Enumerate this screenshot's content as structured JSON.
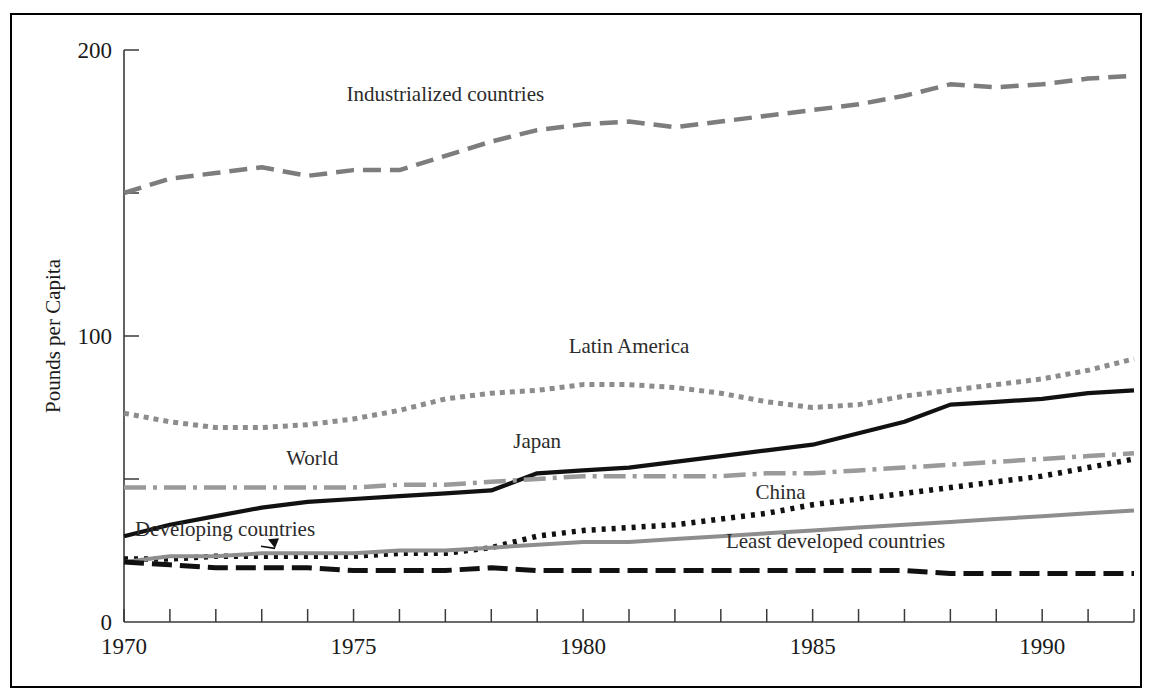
{
  "chart_data": {
    "type": "line",
    "title": "",
    "xlabel": "",
    "ylabel": "Pounds per Capita",
    "xlim": [
      1970,
      1992
    ],
    "ylim": [
      0,
      200
    ],
    "grid": false,
    "legend_position": "inline-labels",
    "y_ticks": [
      0,
      50,
      100,
      150,
      200
    ],
    "y_tick_labels": [
      "0",
      "",
      "100",
      "",
      "200"
    ],
    "x_ticks": [
      1970,
      1971,
      1972,
      1973,
      1974,
      1975,
      1976,
      1977,
      1978,
      1979,
      1980,
      1981,
      1982,
      1983,
      1984,
      1985,
      1986,
      1987,
      1988,
      1989,
      1990,
      1991,
      1992
    ],
    "x_tick_labels": [
      "1970",
      "",
      "",
      "",
      "",
      "1975",
      "",
      "",
      "",
      "",
      "1980",
      "",
      "",
      "",
      "",
      "1985",
      "",
      "",
      "",
      "",
      "1990",
      "",
      ""
    ],
    "x": [
      1970,
      1971,
      1972,
      1973,
      1974,
      1975,
      1976,
      1977,
      1978,
      1979,
      1980,
      1981,
      1982,
      1983,
      1984,
      1985,
      1986,
      1987,
      1988,
      1989,
      1990,
      1991,
      1992
    ],
    "series": [
      {
        "name": "Industrialized countries",
        "color": "#7d7d7d",
        "dash": "18,9",
        "width": 4.5,
        "label_x": 1977.0,
        "label_y": 182,
        "values": [
          150,
          155,
          157,
          159,
          156,
          158,
          158,
          163,
          168,
          172,
          174,
          175,
          173,
          175,
          177,
          179,
          181,
          184,
          188,
          187,
          188,
          190,
          191
        ]
      },
      {
        "name": "Latin America",
        "color": "#8c8c8c",
        "dash": "5,5",
        "width": 5,
        "label_x": 1981.0,
        "label_y": 94,
        "values": [
          73,
          70,
          68,
          68,
          69,
          71,
          74,
          78,
          80,
          81,
          83,
          83,
          82,
          80,
          77,
          75,
          76,
          79,
          81,
          83,
          85,
          88,
          92
        ]
      },
      {
        "name": "Japan",
        "color": "#111111",
        "dash": "",
        "width": 4.2,
        "label_x": 1979.0,
        "label_y": 61,
        "values": [
          30,
          34,
          37,
          40,
          42,
          43,
          44,
          45,
          46,
          52,
          53,
          54,
          56,
          58,
          60,
          62,
          66,
          70,
          76,
          77,
          78,
          80,
          81
        ]
      },
      {
        "name": "World",
        "color": "#9a9a9a",
        "dash": "22,7,4,7",
        "width": 4.5,
        "label_x": 1974.1,
        "label_y": 55,
        "values": [
          47,
          47,
          47,
          47,
          47,
          47,
          48,
          48,
          49,
          50,
          51,
          51,
          51,
          51,
          52,
          52,
          53,
          54,
          55,
          56,
          57,
          58,
          59
        ]
      },
      {
        "name": "China",
        "color": "#111111",
        "dash": "4,6",
        "width": 5.5,
        "label_x": 1984.3,
        "label_y": 43,
        "values": [
          22,
          22,
          23,
          23,
          23,
          23,
          24,
          24,
          26,
          30,
          32,
          33,
          34,
          36,
          38,
          41,
          43,
          45,
          47,
          49,
          51,
          54,
          57
        ]
      },
      {
        "name": "Developing countries",
        "color": "#8e8e8e",
        "dash": "",
        "width": 4,
        "label_x": 1972.2,
        "label_y": 30,
        "arrow": true,
        "values": [
          21,
          23,
          23,
          24,
          24,
          24,
          25,
          25,
          26,
          27,
          28,
          28,
          29,
          30,
          31,
          32,
          33,
          34,
          35,
          36,
          37,
          38,
          39
        ]
      },
      {
        "name": "Least developed countries",
        "color": "#111111",
        "dash": "20,8",
        "width": 5,
        "label_x": 1985.5,
        "label_y": 26,
        "values": [
          21,
          20,
          19,
          19,
          19,
          18,
          18,
          18,
          19,
          18,
          18,
          18,
          18,
          18,
          18,
          18,
          18,
          18,
          17,
          17,
          17,
          17,
          17
        ]
      }
    ]
  }
}
